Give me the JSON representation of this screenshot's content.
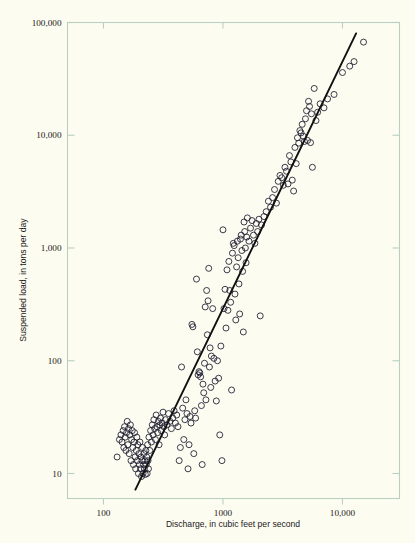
{
  "chart_data": {
    "type": "scatter",
    "title": "",
    "xlabel": "Discharge, in cubic feet per second",
    "ylabel": "Suspended load, in tons per day",
    "xscale": "log",
    "yscale": "log",
    "xlim": [
      50,
      30000
    ],
    "ylim": [
      6,
      100000
    ],
    "grid": false,
    "legend": null,
    "xticks": [
      {
        "value": 100,
        "label": "100"
      },
      {
        "value": 1000,
        "label": "1000"
      },
      {
        "value": 10000,
        "label": "10,000"
      }
    ],
    "yticks": [
      {
        "value": 10,
        "label": "10"
      },
      {
        "value": 100,
        "label": "100"
      },
      {
        "value": 1000,
        "label": "1,000"
      },
      {
        "value": 10000,
        "label": "10,000"
      },
      {
        "value": 100000,
        "label": "100,000"
      }
    ],
    "series": [
      {
        "name": "Suspended load observations",
        "type": "scatter",
        "marker": "open-circle",
        "marker_size": 3.0,
        "color": "#1a1a2e",
        "points": [
          [
            130,
            14
          ],
          [
            136,
            20
          ],
          [
            140,
            22
          ],
          [
            143,
            19
          ],
          [
            146,
            24
          ],
          [
            148,
            17
          ],
          [
            150,
            26
          ],
          [
            152,
            21
          ],
          [
            154,
            16
          ],
          [
            156,
            23
          ],
          [
            158,
            29
          ],
          [
            160,
            18
          ],
          [
            162,
            25
          ],
          [
            164,
            15
          ],
          [
            166,
            22
          ],
          [
            168,
            27
          ],
          [
            170,
            13
          ],
          [
            172,
            20
          ],
          [
            174,
            24
          ],
          [
            176,
            17
          ],
          [
            178,
            12
          ],
          [
            180,
            19
          ],
          [
            182,
            23
          ],
          [
            184,
            14
          ],
          [
            186,
            11
          ],
          [
            188,
            16
          ],
          [
            190,
            21
          ],
          [
            192,
            13
          ],
          [
            194,
            18
          ],
          [
            196,
            10
          ],
          [
            198,
            15
          ],
          [
            200,
            12
          ],
          [
            202,
            19
          ],
          [
            204,
            11
          ],
          [
            206,
            14
          ],
          [
            208,
            9.4
          ],
          [
            210,
            13
          ],
          [
            212,
            17
          ],
          [
            214,
            10
          ],
          [
            216,
            12
          ],
          [
            218,
            15
          ],
          [
            220,
            11
          ],
          [
            222,
            13
          ],
          [
            224,
            9.8
          ],
          [
            226,
            16
          ],
          [
            228,
            12
          ],
          [
            230,
            14
          ],
          [
            232,
            10
          ],
          [
            234,
            18
          ],
          [
            236,
            13
          ],
          [
            238,
            11
          ],
          [
            240,
            21
          ],
          [
            244,
            16
          ],
          [
            248,
            24
          ],
          [
            252,
            19
          ],
          [
            256,
            27
          ],
          [
            260,
            22
          ],
          [
            264,
            30
          ],
          [
            268,
            25
          ],
          [
            272,
            20
          ],
          [
            276,
            33
          ],
          [
            280,
            26
          ],
          [
            284,
            23
          ],
          [
            288,
            29
          ],
          [
            292,
            18
          ],
          [
            296,
            27
          ],
          [
            300,
            31
          ],
          [
            305,
            24
          ],
          [
            310,
            28
          ],
          [
            315,
            35
          ],
          [
            320,
            26
          ],
          [
            325,
            22
          ],
          [
            330,
            30
          ],
          [
            340,
            27
          ],
          [
            350,
            34
          ],
          [
            360,
            29
          ],
          [
            370,
            25
          ],
          [
            380,
            31
          ],
          [
            390,
            36
          ],
          [
            400,
            28
          ],
          [
            410,
            33
          ],
          [
            420,
            26
          ],
          [
            430,
            13
          ],
          [
            440,
            17
          ],
          [
            450,
            88
          ],
          [
            460,
            38
          ],
          [
            470,
            20
          ],
          [
            480,
            30
          ],
          [
            490,
            45
          ],
          [
            500,
            34
          ],
          [
            510,
            11
          ],
          [
            520,
            18
          ],
          [
            530,
            32
          ],
          [
            540,
            28
          ],
          [
            550,
            210
          ],
          [
            560,
            200
          ],
          [
            570,
            15
          ],
          [
            580,
            36
          ],
          [
            590,
            31
          ],
          [
            600,
            530
          ],
          [
            610,
            120
          ],
          [
            620,
            75
          ],
          [
            630,
            80
          ],
          [
            640,
            78
          ],
          [
            650,
            72
          ],
          [
            660,
            40
          ],
          [
            670,
            12
          ],
          [
            680,
            62
          ],
          [
            690,
            52
          ],
          [
            700,
            95
          ],
          [
            710,
            300
          ],
          [
            720,
            45
          ],
          [
            730,
            420
          ],
          [
            740,
            170
          ],
          [
            750,
            340
          ],
          [
            760,
            660
          ],
          [
            770,
            88
          ],
          [
            780,
            130
          ],
          [
            790,
            58
          ],
          [
            800,
            110
          ],
          [
            820,
            290
          ],
          [
            840,
            105
          ],
          [
            860,
            66
          ],
          [
            880,
            44
          ],
          [
            900,
            100
          ],
          [
            920,
            70
          ],
          [
            940,
            22
          ],
          [
            960,
            135
          ],
          [
            980,
            13
          ],
          [
            1000,
            1450
          ],
          [
            1020,
            290
          ],
          [
            1040,
            430
          ],
          [
            1060,
            195
          ],
          [
            1080,
            640
          ],
          [
            1100,
            280
          ],
          [
            1120,
            760
          ],
          [
            1140,
            420
          ],
          [
            1160,
            330
          ],
          [
            1180,
            55
          ],
          [
            1200,
            900
          ],
          [
            1220,
            1100
          ],
          [
            1240,
            1050
          ],
          [
            1260,
            390
          ],
          [
            1280,
            230
          ],
          [
            1300,
            680
          ],
          [
            1320,
            1150
          ],
          [
            1340,
            820
          ],
          [
            1360,
            480
          ],
          [
            1380,
            260
          ],
          [
            1400,
            1200
          ],
          [
            1420,
            1300
          ],
          [
            1440,
            950
          ],
          [
            1460,
            620
          ],
          [
            1480,
            180
          ],
          [
            1500,
            1700
          ],
          [
            1520,
            1400
          ],
          [
            1540,
            1000
          ],
          [
            1560,
            740
          ],
          [
            1580,
            1250
          ],
          [
            1600,
            1850
          ],
          [
            1650,
            1150
          ],
          [
            1700,
            1500
          ],
          [
            1750,
            1750
          ],
          [
            1800,
            1300
          ],
          [
            1850,
            1100
          ],
          [
            1900,
            1650
          ],
          [
            1950,
            1400
          ],
          [
            2000,
            1800
          ],
          [
            2050,
            250
          ],
          [
            2100,
            1600
          ],
          [
            2200,
            1900
          ],
          [
            2300,
            2100
          ],
          [
            2400,
            2600
          ],
          [
            2500,
            2300
          ],
          [
            2600,
            2800
          ],
          [
            2700,
            3300
          ],
          [
            2800,
            2500
          ],
          [
            2900,
            3900
          ],
          [
            3000,
            4400
          ],
          [
            3100,
            4200
          ],
          [
            3200,
            3600
          ],
          [
            3300,
            5200
          ],
          [
            3400,
            4800
          ],
          [
            3500,
            3700
          ],
          [
            3600,
            6600
          ],
          [
            3700,
            5800
          ],
          [
            3800,
            4000
          ],
          [
            3900,
            3200
          ],
          [
            4000,
            7800
          ],
          [
            4100,
            5600
          ],
          [
            4200,
            9500
          ],
          [
            4300,
            8500
          ],
          [
            4400,
            11000
          ],
          [
            4500,
            10500
          ],
          [
            4600,
            12500
          ],
          [
            4700,
            9800
          ],
          [
            4800,
            8800
          ],
          [
            4900,
            14000
          ],
          [
            5000,
            16500
          ],
          [
            5100,
            9000
          ],
          [
            5200,
            20000
          ],
          [
            5300,
            18000
          ],
          [
            5400,
            8600
          ],
          [
            5500,
            15500
          ],
          [
            5600,
            5200
          ],
          [
            5800,
            26000
          ],
          [
            6000,
            13500
          ],
          [
            6200,
            16000
          ],
          [
            6500,
            19000
          ],
          [
            7000,
            17500
          ],
          [
            7500,
            21000
          ],
          [
            8500,
            23000
          ],
          [
            10000,
            36000
          ],
          [
            11500,
            41000
          ],
          [
            12500,
            45000
          ],
          [
            15000,
            67000
          ]
        ]
      },
      {
        "name": "Fitted regression line",
        "type": "line",
        "color": "#111111",
        "x": [
          185,
          13000
        ],
        "y": [
          7.2,
          80000
        ]
      }
    ]
  },
  "axes": {
    "frame_color": "#b9cfc2",
    "background": "#fdfcf1"
  }
}
